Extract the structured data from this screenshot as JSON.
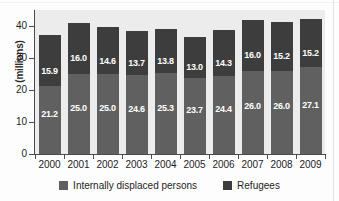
{
  "chart_data": {
    "type": "bar",
    "subtype": "stacked-vertical",
    "title": "",
    "xlabel": "",
    "ylabel": "(millions)",
    "categories": [
      "2000",
      "2001",
      "2002",
      "2003",
      "2004",
      "2005",
      "2006",
      "2007",
      "2008",
      "2009"
    ],
    "series": [
      {
        "name": "Internally displaced persons",
        "color": "#606060",
        "values": [
          21.2,
          25.0,
          25.0,
          24.6,
          25.3,
          23.7,
          24.4,
          26.0,
          26.0,
          27.1
        ],
        "labels": [
          "21.2",
          "25.0",
          "25.0",
          "24.6",
          "25.3",
          "23.7",
          "24.4",
          "26.0",
          "26.0",
          "27.1"
        ]
      },
      {
        "name": "Refugees",
        "color": "#3d3d3d",
        "values": [
          15.9,
          16.0,
          14.6,
          13.7,
          13.8,
          13.0,
          14.3,
          16.0,
          15.2,
          15.2
        ],
        "labels": [
          "15.9",
          "16.0",
          "14.6",
          "13.7",
          "13.8",
          "13.0",
          "14.3",
          "16.0",
          "15.2",
          "15.2"
        ]
      }
    ],
    "totals": [
      37.1,
      41.0,
      39.6,
      38.3,
      39.1,
      36.7,
      38.7,
      42.0,
      41.2,
      42.3
    ],
    "yticks": [
      0,
      10,
      20,
      30,
      40
    ],
    "ytick_labels": [
      "0",
      "10",
      "20",
      "30",
      "40"
    ],
    "ylim": [
      0,
      45
    ],
    "grid": false,
    "legend_position": "bottom",
    "plot_background": "#ececec"
  },
  "legend": {
    "items": [
      {
        "label": "Internally displaced persons",
        "color": "#606060"
      },
      {
        "label": "Refugees",
        "color": "#3d3d3d"
      }
    ]
  }
}
